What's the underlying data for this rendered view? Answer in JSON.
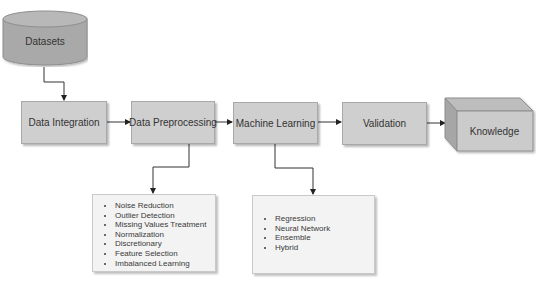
{
  "diagram": {
    "source": {
      "label": "Datasets",
      "shape": "cylinder"
    },
    "pipeline": [
      {
        "id": "integration",
        "label": "Data Integration"
      },
      {
        "id": "preprocessing",
        "label": "Data Preprocessing"
      },
      {
        "id": "ml",
        "label": "Machine Learning"
      },
      {
        "id": "validation",
        "label": "Validation"
      }
    ],
    "output": {
      "label": "Knowledge",
      "shape": "cube"
    },
    "preprocessing_details": {
      "items": [
        "Noise Reduction",
        "Outlier Detection",
        "Missing Values Treatment",
        "Normalization",
        "Discretionary",
        "Feature Selection",
        "Imbalanced Learning"
      ]
    },
    "ml_details": {
      "items": [
        "Regression",
        "Neural Network",
        "Ensemble",
        "Hybrid"
      ]
    },
    "edges": [
      {
        "from": "Datasets",
        "to": "Data Integration"
      },
      {
        "from": "Data Integration",
        "to": "Data Preprocessing"
      },
      {
        "from": "Data Preprocessing",
        "to": "Machine Learning"
      },
      {
        "from": "Machine Learning",
        "to": "Validation"
      },
      {
        "from": "Validation",
        "to": "Knowledge"
      },
      {
        "from": "Data Preprocessing",
        "to": "preprocessing_details"
      },
      {
        "from": "Machine Learning",
        "to": "ml_details"
      }
    ],
    "colors": {
      "node_fill": "#cfcfcf",
      "node_border": "#a8a8a8",
      "list_fill": "#f3f3f3",
      "text": "#333333",
      "connector": "#333333"
    }
  }
}
